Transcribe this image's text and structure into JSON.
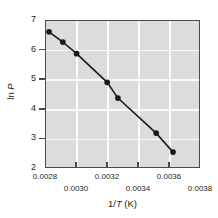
{
  "chart_data": {
    "type": "scatter",
    "title": "",
    "subtitle": "",
    "xlabel": "1/T (K)",
    "xlabel_parts": {
      "prefix": "1/",
      "italic": "T",
      "suffix": " (K)"
    },
    "ylabel": "ln P",
    "ylabel_parts": {
      "prefix": "ln ",
      "italic": "P"
    },
    "xlim": [
      0.0028,
      0.0038
    ],
    "ylim": [
      2,
      7
    ],
    "xticks": [
      0.0028,
      0.003,
      0.0032,
      0.0034,
      0.0036,
      0.0038
    ],
    "xticklabels": [
      "0.0028",
      "0.0030",
      "0.0032",
      "0.0034",
      "0.0036",
      "0.0038"
    ],
    "xticklabel_rows": [
      0,
      1,
      0,
      1,
      0,
      1
    ],
    "yticks": [
      2,
      3,
      4,
      5,
      6,
      7
    ],
    "yticklabels": [
      "7",
      "6",
      "5",
      "4",
      "3",
      "2"
    ],
    "grid": true,
    "grid_color": "#fbfbfb",
    "plot_bg": "#dcdcdc",
    "frame_color": "#4a4a4a",
    "marker_color": "#1a1a1a",
    "line_color": "#1a1a1a",
    "legend": null,
    "x": [
      0.00282,
      0.00291,
      0.003,
      0.0032,
      0.00327,
      0.00352,
      0.00363
    ],
    "y": [
      6.63,
      6.28,
      5.88,
      4.9,
      4.36,
      3.16,
      2.51
    ],
    "series": [
      {
        "name": "ln P vs 1/T",
        "points": [
          {
            "x": 0.00282,
            "y": 6.63
          },
          {
            "x": 0.00291,
            "y": 6.28
          },
          {
            "x": 0.003,
            "y": 5.88
          },
          {
            "x": 0.0032,
            "y": 4.9
          },
          {
            "x": 0.00327,
            "y": 4.36
          },
          {
            "x": 0.00352,
            "y": 3.16
          },
          {
            "x": 0.00363,
            "y": 2.51
          }
        ]
      }
    ]
  },
  "axes": {
    "y_tick_labels": [
      "7",
      "6",
      "5",
      "4",
      "3",
      "2"
    ],
    "x_tick_labels_row_top": [
      "0.0028",
      "0.0032",
      "0.0036"
    ],
    "x_tick_labels_row_bottom": [
      "0.0030",
      "0.0034",
      "0.0038"
    ]
  }
}
